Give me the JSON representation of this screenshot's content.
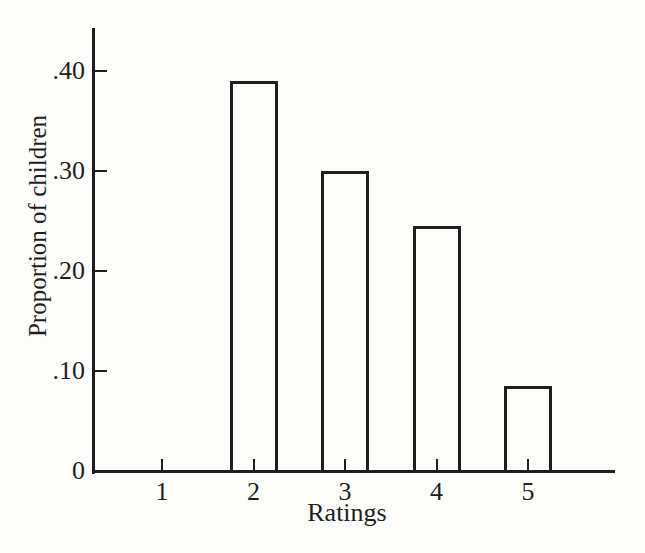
{
  "page": {
    "background": "#fdfdfc",
    "ink": "#1e1e1e"
  },
  "chart_data": {
    "type": "bar",
    "categories": [
      "1",
      "2",
      "3",
      "4",
      "5"
    ],
    "values": [
      0,
      0.39,
      0.3,
      0.245,
      0.085
    ],
    "xlabel": "Ratings",
    "ylabel": "Proportion of children",
    "ytick_labels": [
      "0",
      ".10",
      ".20",
      ".30",
      ".40"
    ],
    "ytick_values": [
      0,
      0.1,
      0.2,
      0.3,
      0.4
    ],
    "ylim": [
      0,
      0.44
    ],
    "grid": false,
    "legend": null,
    "bar_style": {
      "fill": "#fdfdfc",
      "stroke": "#1e1e1e",
      "stroke_width_px": 3
    }
  }
}
